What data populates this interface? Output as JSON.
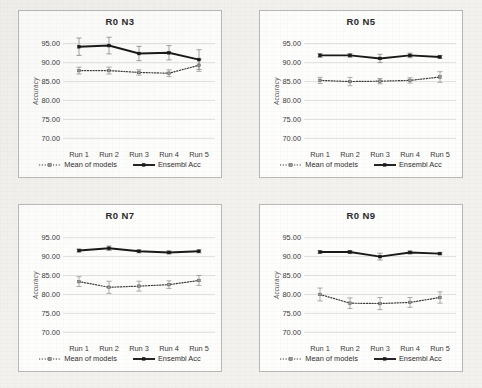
{
  "figure": {
    "panel_count": 4,
    "axis": {
      "ylabel": "Accuracy",
      "yticks": [
        "95.00",
        "90.00",
        "85.00",
        "80.00",
        "75.00",
        "70.00"
      ],
      "ymin": 68.5,
      "ymax": 96.5,
      "xticks": [
        "Run 1",
        "Run 2",
        "Run 3",
        "Run 4",
        "Run 5"
      ]
    },
    "legend": {
      "mean_label": "Mean of models",
      "ensemble_label": "Ensembl Acc",
      "mean_icon": "dotted-line-marker-icon",
      "ensemble_icon": "solid-line-marker-icon"
    },
    "colors": {
      "series_line": "#1a1a1a",
      "mean_marker": "#6e6e6e",
      "gridline": "#d8d8d8",
      "panel_border": "#b9b9b9",
      "page_background": "#f2f1ee",
      "panel_background": "#fdfdfc"
    }
  },
  "chart_data": [
    {
      "type": "line",
      "title": "R0 N3",
      "xlabel": "",
      "ylabel": "Accuracy",
      "categories": [
        "Run 1",
        "Run 2",
        "Run 3",
        "Run 4",
        "Run 5"
      ],
      "ylim": [
        68.5,
        96.5
      ],
      "yticks": [
        95.0,
        90.0,
        85.0,
        80.0,
        75.0,
        70.0
      ],
      "grid": true,
      "legend_position": "bottom",
      "series": [
        {
          "name": "Ensembl Acc",
          "style": "solid",
          "values": [
            94.2,
            94.5,
            92.4,
            92.6,
            90.8
          ],
          "errors": [
            2.3,
            2.2,
            1.9,
            1.9,
            2.6
          ]
        },
        {
          "name": "Mean of models",
          "style": "dotted",
          "values": [
            87.9,
            87.9,
            87.4,
            87.2,
            89.3
          ],
          "errors": [
            0.9,
            0.9,
            0.7,
            0.9,
            1.6
          ]
        }
      ]
    },
    {
      "type": "line",
      "title": "R0 N5",
      "xlabel": "",
      "ylabel": "Accuracy",
      "categories": [
        "Run 1",
        "Run 2",
        "Run 3",
        "Run 4",
        "Run 5"
      ],
      "ylim": [
        68.5,
        96.5
      ],
      "yticks": [
        95.0,
        90.0,
        85.0,
        80.0,
        75.0,
        70.0
      ],
      "grid": true,
      "legend_position": "bottom",
      "series": [
        {
          "name": "Ensembl Acc",
          "style": "solid",
          "values": [
            91.9,
            91.9,
            91.1,
            91.9,
            91.5
          ],
          "errors": [
            0.5,
            0.5,
            1.1,
            0.6,
            0.4
          ]
        },
        {
          "name": "Mean of models",
          "style": "dotted",
          "values": [
            85.3,
            85.0,
            85.1,
            85.3,
            86.2
          ],
          "errors": [
            0.8,
            1.1,
            0.7,
            0.7,
            1.4
          ]
        }
      ]
    },
    {
      "type": "line",
      "title": "R0 N7",
      "xlabel": "",
      "ylabel": "Accuracy",
      "categories": [
        "Run 1",
        "Run 2",
        "Run 3",
        "Run 4",
        "Run 5"
      ],
      "ylim": [
        68.5,
        96.5
      ],
      "yticks": [
        95.0,
        90.0,
        85.0,
        80.0,
        75.0,
        70.0
      ],
      "grid": true,
      "legend_position": "bottom",
      "series": [
        {
          "name": "Ensembl Acc",
          "style": "solid",
          "values": [
            91.6,
            92.2,
            91.4,
            91.1,
            91.4
          ],
          "errors": [
            0.4,
            0.6,
            0.4,
            0.4,
            0.4
          ]
        },
        {
          "name": "Mean of models",
          "style": "dotted",
          "values": [
            83.4,
            81.9,
            82.2,
            82.6,
            83.7
          ],
          "errors": [
            1.3,
            1.6,
            1.3,
            1.0,
            1.3
          ]
        }
      ]
    },
    {
      "type": "line",
      "title": "R0 N9",
      "xlabel": "",
      "ylabel": "Accuracy",
      "categories": [
        "Run 1",
        "Run 2",
        "Run 3",
        "Run 4",
        "Run 5"
      ],
      "ylim": [
        68.5,
        96.5
      ],
      "yticks": [
        95.0,
        90.0,
        85.0,
        80.0,
        75.0,
        70.0
      ],
      "grid": true,
      "legend_position": "bottom",
      "series": [
        {
          "name": "Ensembl Acc",
          "style": "solid",
          "values": [
            91.2,
            91.2,
            90.0,
            91.1,
            90.8
          ],
          "errors": [
            0.3,
            0.4,
            0.9,
            0.4,
            0.3
          ]
        },
        {
          "name": "Mean of models",
          "style": "dotted",
          "values": [
            80.0,
            77.7,
            77.6,
            77.9,
            79.2
          ],
          "errors": [
            1.7,
            1.4,
            1.6,
            1.3,
            1.5
          ]
        }
      ]
    }
  ]
}
